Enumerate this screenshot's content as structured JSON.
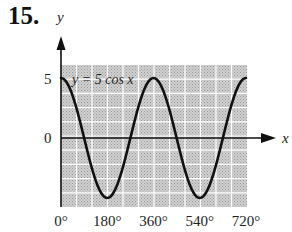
{
  "problem_number": "15.",
  "chart_data": {
    "type": "line",
    "title": "",
    "equation_label": "y = 5 cos x",
    "xlabel": "x",
    "ylabel": "y",
    "x_tick_labels": [
      "0°",
      "180°",
      "360°",
      "540°",
      "720°"
    ],
    "y_tick_labels": [
      "5",
      "0"
    ],
    "xlim": [
      0,
      720
    ],
    "ylim": [
      -5,
      5
    ],
    "grid": true,
    "series": [
      {
        "name": "y = 5 cos x",
        "x": [
          0,
          90,
          180,
          270,
          360,
          450,
          540,
          630,
          720
        ],
        "y": [
          5,
          0,
          -5,
          0,
          5,
          0,
          -5,
          0,
          5
        ]
      }
    ],
    "colors": {
      "grid_bg": "#c8c8c8",
      "grid_line": "#ffffff",
      "curve": "#111111"
    }
  }
}
